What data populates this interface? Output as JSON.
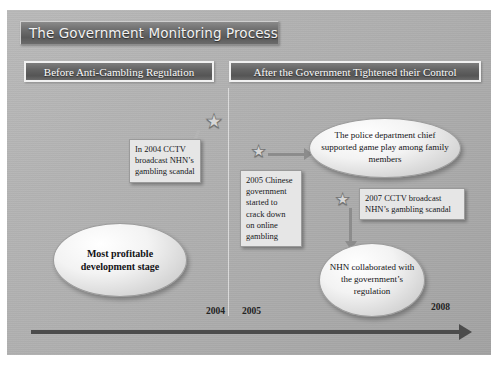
{
  "slide": {
    "title": "The Government Monitoring Process",
    "sections": [
      {
        "id": "before",
        "label": "Before Anti-Gambling  Regulation"
      },
      {
        "id": "after",
        "label": "After the Government Tightened their Control"
      }
    ],
    "timeline": {
      "years": [
        "2004",
        "2005",
        "2008"
      ],
      "axis_arrow": "right-arrow-icon"
    },
    "callouts": [
      {
        "id": "c2004",
        "text": "In 2004 CCTV broadcast NHN’s gambling  scandal"
      },
      {
        "id": "c2005",
        "text": "2005  Chinese government started to crack down on online gambling"
      },
      {
        "id": "c2007",
        "text": "2007  CCTV broadcast NHN’s gambling  scandal"
      }
    ],
    "ovals": [
      {
        "id": "left",
        "text": "Most profitable development stage"
      },
      {
        "id": "police",
        "text": "The police department chief supported game play among family members"
      },
      {
        "id": "nhn",
        "text": "NHN collaborated with the government’s regulation"
      }
    ],
    "stars": [
      {
        "id": "s2004",
        "glyph": "★"
      },
      {
        "id": "s2005",
        "glyph": "★"
      },
      {
        "id": "s2007",
        "glyph": "★"
      }
    ]
  },
  "colors": {
    "slide_background": "#ADADAD",
    "banner_dark": "#5A5A5A",
    "banner_border": "#F1F1F1",
    "callout_fill": "#E6E6E6",
    "oval_fill": "#F3F3F3",
    "axis": "#4C4C4C",
    "connector": "#8C8C8C",
    "title_text": "#F2F2F2"
  }
}
